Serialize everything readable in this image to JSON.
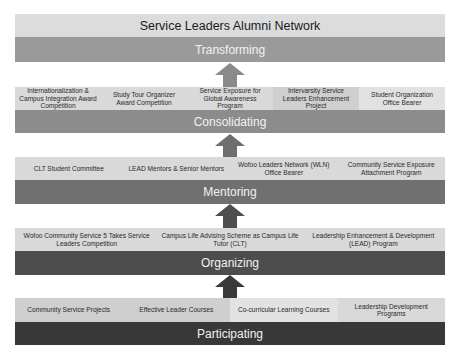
{
  "title": "Service Leaders Alumni Network",
  "layers": [
    {
      "stage": "Transforming",
      "color": "#9a9a9a",
      "items": []
    },
    {
      "stage": "Consolidating",
      "color": "#8c8c8c",
      "items": [
        "Internationalization & Campus Integration Award Competition",
        "Study Tour Organizer Award Competition",
        "Service Exposure for Global Awareness Program",
        "Intervarsity Service Leaders Enhancement Project",
        "Student Organization Office Bearer"
      ]
    },
    {
      "stage": "Mentoring",
      "color": "#707070",
      "items": [
        "CLT Student Committee",
        "LEAD Mentors & Senior Mentors",
        "Wofoo Leaders Network (WLN) Office Bearer",
        "Community Service Exposure Attachment Program"
      ]
    },
    {
      "stage": "Organizing",
      "color": "#4d4d4d",
      "items": [
        "Wofoo Community Service 5 Takes Service Leaders Competition",
        "Campus Life Advising Scheme as Campus Life Tutor (CLT)",
        "Leadership Enhancement & Development (LEAD) Program"
      ]
    },
    {
      "stage": "Participating",
      "color": "#383838",
      "items": [
        "Community Service Projects",
        "Effective Leader Courses",
        "Co-curricular Learning Courses",
        "Leadership Development Programs"
      ]
    }
  ],
  "arrow_colors": [
    "#8a8a8a",
    "#6e6e6e",
    "#4e4e4e",
    "#3a3a3a"
  ]
}
